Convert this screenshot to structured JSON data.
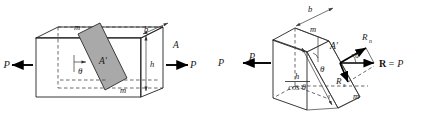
{
  "figure": {
    "background_color": "#ffffff",
    "ink_color": "#222222",
    "shaded_plane_color": "#a9a9a9"
  },
  "left_panel": {
    "name": "prismatic-bar-with-inclined-section",
    "labels": {
      "load_left": "P",
      "load_right": "P",
      "section_mark_top": "m",
      "section_mark_bottom": "m",
      "width_dim": "b",
      "height_dim": "h",
      "cross_section_area": "A",
      "inclined_area": "A′",
      "angle": "θ"
    }
  },
  "right_panel": {
    "name": "free-body-of-cut-bar-with-resultants",
    "labels": {
      "load_outside": "P",
      "load_inside": "P",
      "section_mark_top": "m",
      "section_mark_bottom": "m",
      "width_dim": "b",
      "inclined_area": "A′",
      "angle_body": "θ",
      "angle_force": "θ",
      "inclined_height_numerator": "h",
      "inclined_height_denominator": "cos θ",
      "normal_force": "R",
      "normal_force_sub": "n",
      "shear_force": "R",
      "shear_force_sub": "s",
      "resultant": "R = P",
      "resultant_bold": "R",
      "resultant_equals": "= P"
    }
  }
}
